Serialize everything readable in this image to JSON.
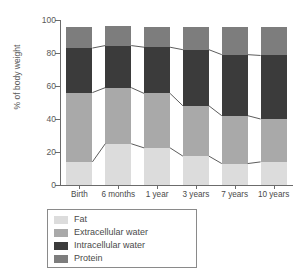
{
  "chart_data": {
    "type": "bar",
    "subtype": "stacked-bar-100",
    "title": "",
    "xlabel": "",
    "ylabel": "% of body weight",
    "ylim": [
      0,
      100
    ],
    "yticks": [
      0,
      20,
      40,
      60,
      80,
      100
    ],
    "grid": false,
    "legend_position": "below-axes",
    "categories": [
      "Birth",
      "6 months",
      "1 year",
      "3 years",
      "7 years",
      "10 years"
    ],
    "series": [
      {
        "name": "Fat",
        "color": "#dcdcdc",
        "values": [
          14,
          25,
          22.5,
          17.5,
          13,
          14
        ]
      },
      {
        "name": "Extracellular water",
        "color": "#a9a9a9",
        "values": [
          42,
          34,
          33,
          30.5,
          29,
          26
        ]
      },
      {
        "name": "Intracellular water",
        "color": "#3b3b3b",
        "values": [
          27,
          25.5,
          28,
          34,
          37,
          38.5
        ]
      },
      {
        "name": "Protein",
        "color": "#7d7d7d",
        "values": [
          13,
          12,
          12.5,
          14,
          16.5,
          17
        ]
      }
    ],
    "cumulative_boundaries": {
      "fat_top": [
        14,
        25,
        22.5,
        17.5,
        13,
        14
      ],
      "extracellular_top": [
        56,
        59,
        55.5,
        48,
        42,
        40
      ],
      "intracellular_top": [
        83,
        84.5,
        83.5,
        82,
        79,
        78.5
      ],
      "protein_top": [
        96,
        96.5,
        96,
        96,
        95.5,
        95.5
      ]
    },
    "annotations": []
  },
  "legend": {
    "items": [
      {
        "label": "Fat"
      },
      {
        "label": "Extracellular water"
      },
      {
        "label": "Intracellular water"
      },
      {
        "label": "Protein"
      }
    ]
  }
}
